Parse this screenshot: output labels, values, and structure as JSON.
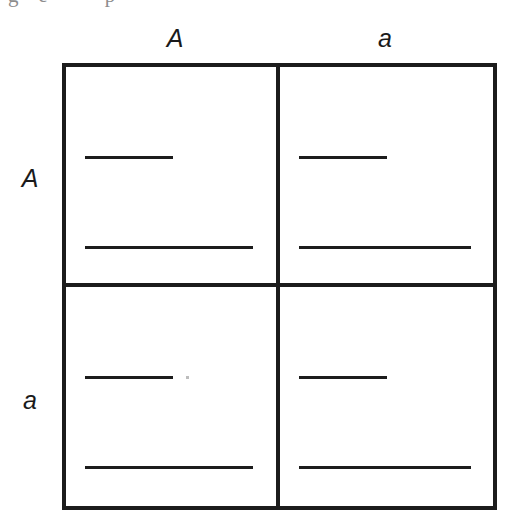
{
  "figure": {
    "type": "punnett-square",
    "rows": 2,
    "columns": 2
  },
  "crop_remnant": {
    "text": "g   e         p"
  },
  "column_labels": [
    {
      "id": "col-A",
      "text": "A"
    },
    {
      "id": "col-a",
      "text": "a"
    }
  ],
  "row_labels": [
    {
      "id": "row-A",
      "text": "A"
    },
    {
      "id": "row-a",
      "text": "a"
    }
  ],
  "cells": [
    {
      "id": "cell-A-A",
      "row": "A",
      "column": "A",
      "lines": [
        {
          "id": "upper",
          "value": "",
          "length": "short"
        },
        {
          "id": "lower",
          "value": "",
          "length": "long"
        }
      ]
    },
    {
      "id": "cell-A-a",
      "row": "A",
      "column": "a",
      "lines": [
        {
          "id": "upper",
          "value": "",
          "length": "short"
        },
        {
          "id": "lower",
          "value": "",
          "length": "long"
        }
      ]
    },
    {
      "id": "cell-a-A",
      "row": "a",
      "column": "A",
      "lines": [
        {
          "id": "upper",
          "value": "",
          "length": "short"
        },
        {
          "id": "lower",
          "value": "",
          "length": "long"
        }
      ]
    },
    {
      "id": "cell-a-a",
      "row": "a",
      "column": "a",
      "lines": [
        {
          "id": "upper",
          "value": "",
          "length": "short"
        },
        {
          "id": "lower",
          "value": "",
          "length": "long"
        }
      ]
    }
  ],
  "colors": {
    "ink": "#1c1c1c",
    "paper": "#ffffff",
    "faint_artifact": "#bdbdbd"
  }
}
